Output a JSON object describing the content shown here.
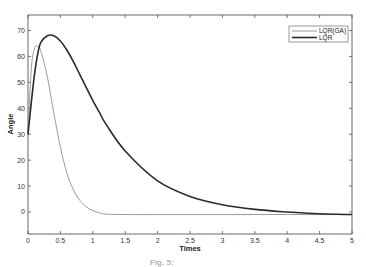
{
  "chart_data": {
    "type": "line",
    "title": "",
    "xlabel": "Times",
    "ylabel": "Angle",
    "xlim": [
      0,
      5
    ],
    "ylim": [
      -8.5,
      76
    ],
    "grid": false,
    "legend_position": "upper right",
    "x_ticks": [
      0,
      0.5,
      1,
      1.5,
      2,
      2.5,
      3,
      3.5,
      4,
      4.5,
      5
    ],
    "x_tick_labels": [
      "0",
      "0.5",
      "1",
      "1.5",
      "2",
      "2.5",
      "3",
      "3.5",
      "4",
      "4.5",
      "5"
    ],
    "y_ticks": [
      0,
      10,
      20,
      30,
      40,
      50,
      60,
      70
    ],
    "y_tick_labels": [
      "0",
      "10",
      "20",
      "30",
      "40",
      "50",
      "60",
      "70"
    ],
    "x": [
      0,
      0.05,
      0.1,
      0.15,
      0.2,
      0.3,
      0.4,
      0.5,
      0.6,
      0.7,
      0.8,
      0.9,
      1.0,
      1.1,
      1.2,
      1.5,
      2.0,
      2.5,
      3.0,
      3.5,
      4.0,
      4.5,
      5.0
    ],
    "series": [
      {
        "name": "LQR(GA)",
        "color": "#9a9a9a",
        "values": [
          30,
          55,
          63,
          64,
          62,
          52,
          38,
          25,
          15,
          8.5,
          4.5,
          2,
          0.5,
          -0.3,
          -0.8,
          -1,
          -1,
          -1,
          -1,
          -1,
          -1,
          -1,
          -1
        ]
      },
      {
        "name": "LQR",
        "color": "#2a2a2a",
        "values": [
          30,
          42,
          53,
          61,
          65.5,
          68,
          68,
          66,
          62.5,
          58,
          53,
          48,
          43,
          38.5,
          34,
          23.5,
          12,
          6,
          2.8,
          1,
          0,
          -0.7,
          -1
        ]
      }
    ]
  },
  "legend": {
    "items": [
      {
        "label": "LQR(GA)",
        "color": "#9a9a9a"
      },
      {
        "label": "LQR",
        "color": "#2a2a2a"
      }
    ]
  },
  "caption": "Fig. 5: "
}
